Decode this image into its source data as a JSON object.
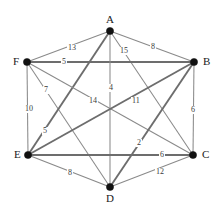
{
  "figure": {
    "background_color": "#ffffff",
    "edge_color": "#8a8a8a",
    "vertex_color": "#111111",
    "label_color": "#1a1a1a"
  },
  "chart_data": {
    "type": "diagram",
    "diagram_kind": "weighted-undirected-graph",
    "title": "",
    "vertices": [
      {
        "id": "A",
        "label": "A",
        "x": 110,
        "y": 31,
        "label_x": 106,
        "label_y": 14
      },
      {
        "id": "B",
        "label": "B",
        "x": 194,
        "y": 62,
        "label_x": 203,
        "label_y": 56
      },
      {
        "id": "C",
        "label": "C",
        "x": 193,
        "y": 155,
        "label_x": 202,
        "label_y": 149
      },
      {
        "id": "D",
        "label": "D",
        "x": 110,
        "y": 187,
        "label_x": 106,
        "label_y": 193
      },
      {
        "id": "E",
        "label": "E",
        "x": 28,
        "y": 155,
        "label_x": 14,
        "label_y": 149
      },
      {
        "id": "F",
        "label": "F",
        "x": 27,
        "y": 62,
        "label_x": 13,
        "label_y": 56
      }
    ],
    "edges": [
      {
        "source": "F",
        "target": "A",
        "weight": 13,
        "label": "13",
        "label_x": 67,
        "label_y": 44,
        "thick": false
      },
      {
        "source": "A",
        "target": "B",
        "weight": 8,
        "label": "8",
        "label_x": 150,
        "label_y": 43,
        "thick": false
      },
      {
        "source": "A",
        "target": "C",
        "weight": 15,
        "label": "15",
        "label_x": 119,
        "label_y": 47,
        "thick": false
      },
      {
        "source": "F",
        "target": "B",
        "weight": 5,
        "label": "5",
        "label_x": 61,
        "label_y": 58,
        "thick": true
      },
      {
        "source": "A",
        "target": "D",
        "weight": 4,
        "label": "4",
        "label_x": 108,
        "label_y": 84,
        "thick": false
      },
      {
        "source": "F",
        "target": "D",
        "weight": 7,
        "label": "7",
        "label_x": 43,
        "label_y": 86,
        "thick": false
      },
      {
        "source": "F",
        "target": "E",
        "weight": 10,
        "label": "10",
        "label_x": 24,
        "label_y": 105,
        "thick": false
      },
      {
        "source": "A",
        "target": "E",
        "weight": 14,
        "label": "14",
        "label_x": 88,
        "label_y": 97,
        "thick": true
      },
      {
        "source": "F",
        "target": "C",
        "weight": 11,
        "label": "11",
        "label_x": 131,
        "label_y": 97,
        "thick": false
      },
      {
        "source": "B",
        "target": "C",
        "weight": 6,
        "label": "6",
        "label_x": 190,
        "label_y": 106,
        "thick": false
      },
      {
        "source": "E",
        "target": "B",
        "weight": 5,
        "label": "5",
        "label_x": 42,
        "label_y": 127,
        "thick": true
      },
      {
        "source": "D",
        "target": "B",
        "weight": 2,
        "label": "2",
        "label_x": 136,
        "label_y": 139,
        "thick": true
      },
      {
        "source": "E",
        "target": "C",
        "weight": 6,
        "label": "6",
        "label_x": 159,
        "label_y": 151,
        "thick": true
      },
      {
        "source": "E",
        "target": "D",
        "weight": 8,
        "label": "8",
        "label_x": 67,
        "label_y": 169,
        "thick": false
      },
      {
        "source": "D",
        "target": "C",
        "weight": 12,
        "label": "12",
        "label_x": 155,
        "label_y": 168,
        "thick": false
      }
    ]
  }
}
